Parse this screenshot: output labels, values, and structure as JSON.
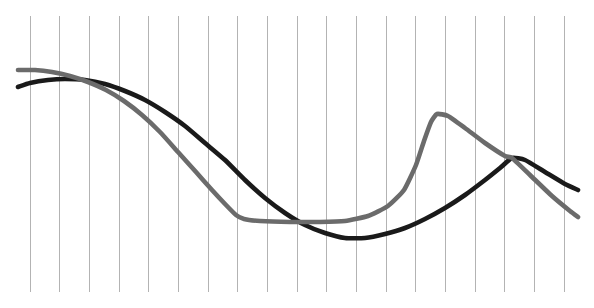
{
  "chart_data": {
    "type": "line",
    "title": "",
    "subtitle": "",
    "xlabel": "",
    "ylabel": "",
    "xlim": [
      0,
      18
    ],
    "ylim": [
      0,
      100
    ],
    "grid": true,
    "grid_axis": "x",
    "grid_color": "#b3b3b3",
    "grid_count": 19,
    "legend": false,
    "legend_position": "none",
    "background": "#ffffff",
    "plot_area": {
      "left": 30,
      "right": 564,
      "top": 16,
      "bottom": 292,
      "width": 594,
      "height": 308
    },
    "x_tick_labels": [],
    "y_tick_labels": [],
    "annotations": [],
    "x": [
      0,
      1,
      2,
      3,
      4,
      5,
      6,
      7,
      8,
      9,
      10,
      11,
      12,
      13,
      14,
      15,
      16,
      17,
      18
    ],
    "series": [
      {
        "name": "series-1",
        "color": "#1a1a1a",
        "stroke_width": 4.6,
        "values": [
          74,
          76,
          76,
          75,
          72,
          68,
          62,
          54,
          45,
          36,
          28,
          23,
          22,
          26,
          33,
          41,
          49,
          52,
          45
        ],
        "points": [
          [
            18,
            87
          ],
          [
            30,
            83
          ],
          [
            48,
            80
          ],
          [
            65,
            79
          ],
          [
            85,
            80
          ],
          [
            105,
            84
          ],
          [
            125,
            91
          ],
          [
            145,
            100
          ],
          [
            165,
            112
          ],
          [
            185,
            126
          ],
          [
            205,
            143
          ],
          [
            225,
            160
          ],
          [
            245,
            180
          ],
          [
            265,
            198
          ],
          [
            285,
            213
          ],
          [
            305,
            225
          ],
          [
            325,
            233
          ],
          [
            345,
            238
          ],
          [
            365,
            238
          ],
          [
            385,
            234
          ],
          [
            405,
            228
          ],
          [
            425,
            219
          ],
          [
            445,
            208
          ],
          [
            465,
            195
          ],
          [
            485,
            180
          ],
          [
            500,
            168
          ],
          [
            512,
            158
          ],
          [
            525,
            160
          ],
          [
            545,
            172
          ],
          [
            565,
            184
          ],
          [
            578,
            190
          ]
        ]
      },
      {
        "name": "series-2",
        "color": "#6b6b6b",
        "stroke_width": 4.6,
        "values": [
          80,
          80,
          79,
          76,
          71,
          63,
          54,
          43,
          31,
          28,
          28,
          28,
          29,
          33,
          48,
          62,
          58,
          50,
          36
        ],
        "points": [
          [
            18,
            70
          ],
          [
            35,
            70
          ],
          [
            52,
            72
          ],
          [
            70,
            76
          ],
          [
            88,
            82
          ],
          [
            106,
            90
          ],
          [
            124,
            101
          ],
          [
            142,
            115
          ],
          [
            160,
            132
          ],
          [
            178,
            152
          ],
          [
            196,
            172
          ],
          [
            212,
            190
          ],
          [
            226,
            205
          ],
          [
            236,
            215
          ],
          [
            244,
            219
          ],
          [
            260,
            221
          ],
          [
            290,
            222
          ],
          [
            320,
            222
          ],
          [
            345,
            221
          ],
          [
            368,
            216
          ],
          [
            388,
            206
          ],
          [
            404,
            190
          ],
          [
            416,
            165
          ],
          [
            424,
            141
          ],
          [
            431,
            122
          ],
          [
            437,
            114
          ],
          [
            448,
            116
          ],
          [
            465,
            128
          ],
          [
            485,
            143
          ],
          [
            505,
            156
          ],
          [
            512,
            158
          ],
          [
            530,
            175
          ],
          [
            552,
            196
          ],
          [
            570,
            211
          ],
          [
            578,
            217
          ]
        ]
      }
    ]
  }
}
